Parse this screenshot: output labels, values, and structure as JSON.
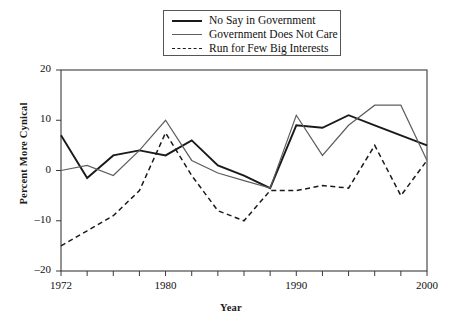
{
  "chart_data": {
    "type": "line",
    "title": "",
    "xlabel": "Year",
    "ylabel": "Percent More Cynical",
    "xlim": [
      1972,
      2000
    ],
    "ylim": [
      -20,
      20
    ],
    "grid": false,
    "legend_position": "top-center",
    "x_ticks_major": [
      1972,
      1980,
      1990,
      2000
    ],
    "x_tick_labels": [
      "1972",
      "1980",
      "1990",
      "2000"
    ],
    "x_ticks_minor_step": 2,
    "y_ticks": [
      -20,
      -10,
      0,
      10,
      20
    ],
    "y_tick_labels": [
      "-20",
      "-10",
      "0",
      "10",
      "20"
    ],
    "x": [
      1972,
      1974,
      1976,
      1978,
      1980,
      1982,
      1984,
      1986,
      1988,
      1990,
      1992,
      1994,
      1996,
      1998,
      2000
    ],
    "series": [
      {
        "name": "No Say in Government",
        "style": "solid",
        "color": "#1a1a1a",
        "width": 1.9,
        "values": [
          7,
          -1.5,
          3,
          4,
          3,
          6,
          1,
          -1,
          -3.5,
          9,
          8.5,
          11,
          9,
          7,
          5
        ]
      },
      {
        "name": "Government Does Not Care",
        "style": "solid",
        "color": "#5e5e5e",
        "width": 1.2,
        "values": [
          0,
          1,
          -1,
          4,
          10,
          2,
          -0.5,
          -2,
          -3.5,
          11,
          3,
          9,
          13,
          13,
          2
        ]
      },
      {
        "name": "Run for Few Big Interests",
        "style": "dashed",
        "color": "#1a1a1a",
        "width": 1.5,
        "values": [
          -15,
          -12,
          -9,
          -4,
          7.5,
          -1,
          -8,
          -10,
          -4,
          -4,
          -3,
          -3.5,
          5,
          -5,
          2
        ]
      }
    ]
  },
  "legend": {
    "items": [
      {
        "label": "No Say in Government",
        "swatch": "solid-dark"
      },
      {
        "label": "Government Does Not Care",
        "swatch": "solid-gray"
      },
      {
        "label": "Run for Few Big Interests",
        "swatch": "dashed"
      }
    ]
  },
  "axes": {
    "y_title": "Percent More Cynical",
    "x_title": "Year",
    "y_labels": [
      "20",
      "10",
      "0",
      "-10",
      "-20"
    ],
    "x_labels": [
      "1972",
      "1980",
      "1990",
      "2000"
    ]
  }
}
